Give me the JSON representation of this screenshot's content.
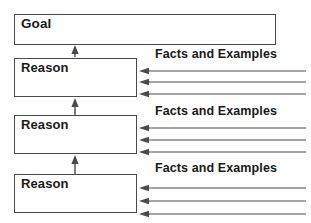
{
  "diagram": {
    "colors": {
      "box_stroke": "#4a4a4a",
      "arrow_stroke": "#4a4a4a",
      "text": "#1a1a1a",
      "background": "#ffffff"
    },
    "nodes": [
      {
        "id": "goal",
        "label": "Goal",
        "x": 14,
        "y": 14,
        "width": 262,
        "height": 31
      },
      {
        "id": "reason-1",
        "label": "Reason",
        "x": 14,
        "y": 58,
        "width": 123,
        "height": 39
      },
      {
        "id": "reason-2",
        "label": "Reason",
        "x": 14,
        "y": 115,
        "width": 123,
        "height": 39
      },
      {
        "id": "reason-3",
        "label": "Reason",
        "x": 14,
        "y": 174,
        "width": 123,
        "height": 39
      }
    ],
    "support_labels": [
      {
        "id": "facts-1",
        "text": "Facts and Examples",
        "x": 155,
        "y": 47
      },
      {
        "id": "facts-2",
        "text": "Facts and Examples",
        "x": 155,
        "y": 104
      },
      {
        "id": "facts-3",
        "text": "Facts and Examples",
        "x": 155,
        "y": 161
      }
    ],
    "vertical_arrows": [
      {
        "id": "arrow-reason1-to-goal",
        "x": 75,
        "from_y": 57,
        "to_y": 45
      },
      {
        "id": "arrow-reason2-to-reason1",
        "x": 75,
        "from_y": 115,
        "to_y": 98
      },
      {
        "id": "arrow-reason3-to-reason2",
        "x": 75,
        "from_y": 174,
        "to_y": 155
      }
    ],
    "horizontal_arrows": [
      {
        "id": "fact-arrow-1-1",
        "y": 71,
        "from_x": 306,
        "to_x": 139
      },
      {
        "id": "fact-arrow-1-2",
        "y": 82,
        "from_x": 306,
        "to_x": 139
      },
      {
        "id": "fact-arrow-1-3",
        "y": 94,
        "from_x": 306,
        "to_x": 139
      },
      {
        "id": "fact-arrow-2-1",
        "y": 128,
        "from_x": 306,
        "to_x": 139
      },
      {
        "id": "fact-arrow-2-2",
        "y": 140,
        "from_x": 306,
        "to_x": 139
      },
      {
        "id": "fact-arrow-2-3",
        "y": 152,
        "from_x": 306,
        "to_x": 139
      },
      {
        "id": "fact-arrow-3-1",
        "y": 188,
        "from_x": 306,
        "to_x": 139
      },
      {
        "id": "fact-arrow-3-2",
        "y": 201,
        "from_x": 306,
        "to_x": 139
      },
      {
        "id": "fact-arrow-3-3",
        "y": 214,
        "from_x": 306,
        "to_x": 139
      }
    ]
  }
}
